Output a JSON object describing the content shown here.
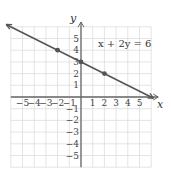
{
  "chart_data": {
    "type": "line",
    "title": "",
    "equation_label": "x + 2y = 6",
    "xlabel": "x",
    "ylabel": "y",
    "xlim": [
      -6,
      6.5
    ],
    "ylim": [
      -6,
      6
    ],
    "grid": true,
    "x_ticks": [
      "-5",
      "-4",
      "-3",
      "-2",
      "-1",
      "1",
      "2",
      "3",
      "4",
      "5"
    ],
    "y_ticks": [
      "5",
      "4",
      "3",
      "2",
      "1",
      "-1",
      "-2",
      "-3",
      "-4",
      "-5"
    ],
    "series": [
      {
        "name": "x + 2y = 6",
        "points": [
          [
            -2,
            4
          ],
          [
            0,
            3
          ],
          [
            2,
            2
          ],
          [
            6,
            0
          ]
        ],
        "line_color": "#555555"
      }
    ],
    "line_extends": "both directions (arrows)"
  }
}
